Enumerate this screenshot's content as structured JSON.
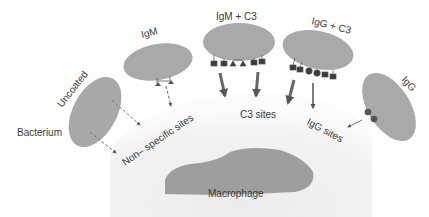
{
  "diagram": {
    "type": "opsonization-phagocytosis",
    "bacteria": [
      {
        "id": "uncoated",
        "label": "Uncoated"
      },
      {
        "id": "igm",
        "label": "IgM"
      },
      {
        "id": "igm_c3",
        "label": "IgM + C3"
      },
      {
        "id": "igg_c3",
        "label": "IgG + C3"
      },
      {
        "id": "igg",
        "label": "IgG"
      }
    ],
    "side_label": "Bacterium",
    "sites": {
      "nonspecific": "Non– specific sites",
      "c3": "C3 sites",
      "igg": "IgG sites"
    },
    "cell_label": "Macrophage",
    "colors": {
      "bacterium": "#a9a9a9",
      "dome": "#f1f1f1",
      "macrophage": "#9c9c9c",
      "marker": "#3c3c3c",
      "arrow": "#555555"
    }
  }
}
